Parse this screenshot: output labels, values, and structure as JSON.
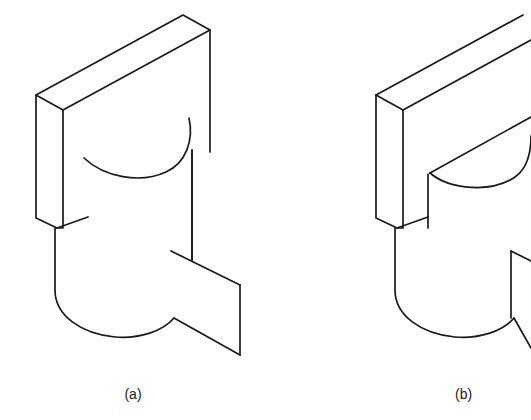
{
  "figure": {
    "kind": "isometric-technical-drawing",
    "background_color": "#ffffff",
    "line_color": "#1a1a1a",
    "caption_color": "#1a1a1a",
    "parts": [
      {
        "id": "a",
        "caption": "(a)",
        "description": "Isometric view of a vertical cylinder with a flat rectangular slab standing behind it and a flat flange plate projecting to the right; the top rim of the cylinder is drawn as a single open arc passing in front of the slab."
      },
      {
        "id": "b",
        "caption": "(b)",
        "description": "Isometric view of the same cylinder and slab assembly, but the top rim of the cylinder is drawn as a closed half ellipse with a straight chord meeting the slab face; the view is cropped at the right edge of the image."
      }
    ],
    "captions": [
      {
        "label": "(a)",
        "x": 133,
        "y": 399
      },
      {
        "label": "(b)",
        "x": 455,
        "y": 399
      }
    ]
  }
}
